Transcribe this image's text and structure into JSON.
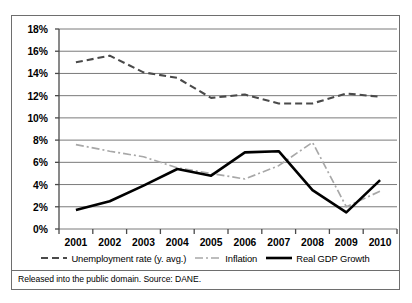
{
  "footer": {
    "text": "Released into the public domain. Source: DANE."
  },
  "legend": {
    "entries": [
      {
        "label": "Unemployment rate (y. avg.)",
        "style": "dashed",
        "color": "#4a4a4a"
      },
      {
        "label": "Inflation",
        "style": "dashdot",
        "color": "#a8a8a8"
      },
      {
        "label": "Real GDP Growth",
        "style": "solid",
        "color": "#000000"
      }
    ]
  },
  "chart_data": {
    "type": "line",
    "title": "",
    "xlabel": "",
    "ylabel": "",
    "categories": [
      "2001",
      "2002",
      "2003",
      "2004",
      "2005",
      "2006",
      "2007",
      "2008",
      "2009",
      "2010"
    ],
    "ytick_labels": [
      "0%",
      "2%",
      "4%",
      "6%",
      "8%",
      "10%",
      "12%",
      "14%",
      "16%",
      "18%"
    ],
    "ytick_values": [
      0,
      2,
      4,
      6,
      8,
      10,
      12,
      14,
      16,
      18
    ],
    "ylim": [
      0,
      18
    ],
    "grid": true,
    "legend_position": "bottom",
    "series": [
      {
        "name": "Unemployment rate (y. avg.)",
        "style": "dashed",
        "color": "#4a4a4a",
        "values": [
          15.0,
          15.6,
          14.1,
          13.6,
          11.8,
          12.1,
          11.3,
          11.3,
          12.2,
          11.9
        ]
      },
      {
        "name": "Inflation",
        "style": "dashdot",
        "color": "#a8a8a8",
        "values": [
          7.6,
          7.0,
          6.5,
          5.5,
          5.0,
          4.5,
          5.7,
          7.8,
          2.0,
          3.4
        ]
      },
      {
        "name": "Real GDP Growth",
        "style": "solid",
        "color": "#000000",
        "values": [
          1.7,
          2.5,
          3.9,
          5.4,
          4.8,
          6.9,
          7.0,
          3.5,
          1.5,
          4.4
        ]
      }
    ]
  }
}
